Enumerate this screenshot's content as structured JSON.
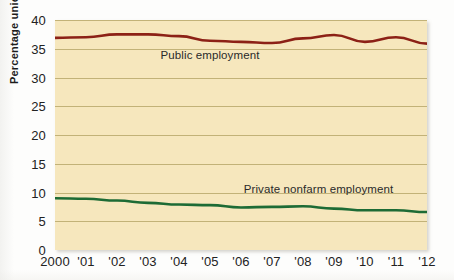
{
  "chart_data": {
    "type": "line",
    "title": "",
    "subtitle": "",
    "xlabel": "",
    "ylabel": "Percentage unionized",
    "x": [
      2000,
      2001,
      2002,
      2003,
      2004,
      2005,
      2006,
      2007,
      2008,
      2009,
      2010,
      2011,
      2012
    ],
    "xtick_labels": [
      "2000",
      "'01",
      "'02",
      "'03",
      "'04",
      "'05",
      "'06",
      "'07",
      "'08",
      "'09",
      "'10",
      "'11",
      "'12"
    ],
    "ytick_labels": [
      "0",
      "5",
      "10",
      "15",
      "20",
      "25",
      "30",
      "35",
      "40"
    ],
    "ytick_values": [
      0,
      5,
      10,
      15,
      20,
      25,
      30,
      35,
      40
    ],
    "xlim": [
      2000,
      2012
    ],
    "ylim": [
      0,
      40
    ],
    "grid": true,
    "grid_axis": "y",
    "legend": "inline-annotations",
    "series": [
      {
        "name": "Public employment",
        "color": "#8c2116",
        "values": [
          36.9,
          37.0,
          37.5,
          37.5,
          37.2,
          36.4,
          36.2,
          36.0,
          36.8,
          37.4,
          36.2,
          37.0,
          35.9
        ],
        "label_text": "Public employment"
      },
      {
        "name": "Private nonfarm employment",
        "color": "#1d6b35",
        "values": [
          9.0,
          8.9,
          8.6,
          8.2,
          7.9,
          7.8,
          7.4,
          7.5,
          7.6,
          7.2,
          6.9,
          6.9,
          6.6
        ],
        "label_text": "Private nonfarm employment"
      }
    ],
    "annotations": [
      {
        "text": "Public employment",
        "x": 2005.0,
        "y": 33.5
      },
      {
        "text": "Private nonfarm employment",
        "x": 2008.5,
        "y": 10.3
      }
    ]
  },
  "colors": {
    "plot_background": "#f6e7bd",
    "gridline": "#b9a86c",
    "public_line": "#8c2116",
    "private_line": "#1d6b35",
    "text": "#1c1c1c"
  }
}
